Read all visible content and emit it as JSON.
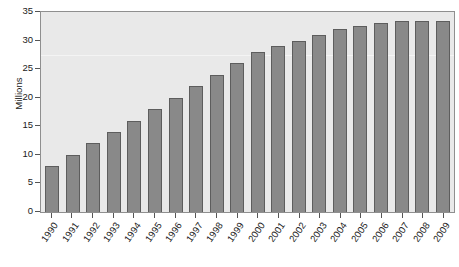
{
  "chart_data": {
    "type": "bar",
    "title": "",
    "subtitle": "",
    "xlabel": "",
    "ylabel": "Millions",
    "ylim": [
      0,
      35
    ],
    "yticks": [
      0,
      5,
      10,
      15,
      20,
      25,
      30,
      35
    ],
    "ytick_labels": [
      "0",
      "5",
      "10",
      "15",
      "20",
      "25",
      "30",
      "35"
    ],
    "grid": true,
    "legend": null,
    "categories": [
      "1990",
      "1991",
      "1992",
      "1993",
      "1994",
      "1995",
      "1996",
      "1997",
      "1998",
      "1999",
      "2000",
      "2001",
      "2002",
      "2003",
      "2004",
      "2005",
      "2006",
      "2007",
      "2008",
      "2009"
    ],
    "values": [
      8,
      10,
      12,
      14,
      16,
      18,
      20,
      22,
      24,
      26,
      28,
      29,
      30,
      31,
      32,
      32.5,
      33,
      33.5,
      33.5,
      33.5
    ],
    "colors": {
      "bar_fill": "#898989",
      "bar_border": "#5d5d5d",
      "plot_background": "#e9e9e9",
      "plot_border": "#8f8f8f",
      "gridline": "#f4f4f4",
      "text": "#1a1a1a",
      "page_background": "#ffffff"
    }
  }
}
